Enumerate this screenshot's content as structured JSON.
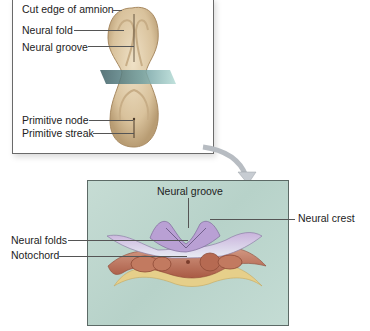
{
  "figure": {
    "top_panel": {
      "title": "Dorsal view of embryo",
      "labels": [
        {
          "id": "cut-edge-of-amnion",
          "text": "Cut edge of amnion"
        },
        {
          "id": "neural-fold",
          "text": "Neural fold"
        },
        {
          "id": "neural-groove",
          "text": "Neural groove"
        },
        {
          "id": "primitive-node",
          "text": "Primitive node"
        },
        {
          "id": "primitive-streak",
          "text": "Primitive streak"
        }
      ]
    },
    "bottom_panel": {
      "title": "Cross section",
      "labels": [
        {
          "id": "neural-groove",
          "text": "Neural groove"
        },
        {
          "id": "neural-crest",
          "text": "Neural crest"
        },
        {
          "id": "neural-folds",
          "text": "Neural folds"
        },
        {
          "id": "notochord",
          "text": "Notochord"
        }
      ]
    },
    "colors": {
      "embryo_tan": "#d8c3a0",
      "panel_teal": "#bcd6cd",
      "ectoderm_lavender": "#b9a3cf",
      "mesoderm_rust": "#b9684f",
      "endoderm_yellow": "#e8cf86",
      "plane_teal": "#7fb8b0"
    }
  }
}
